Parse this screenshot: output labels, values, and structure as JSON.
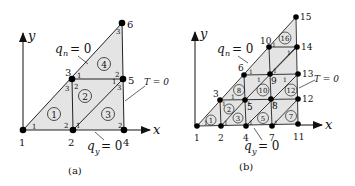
{
  "panels": [
    {
      "caption": "(a)",
      "axes": {
        "x_label": "x",
        "y_label": "y"
      },
      "boundary_conditions": {
        "hypotenuse": {
          "symbol": "q",
          "subscript": "n",
          "text": "= 0"
        },
        "bottom": {
          "symbol": "q",
          "subscript": "y",
          "text": "= 0"
        },
        "right": {
          "text": "T = 0"
        }
      },
      "nodes": [
        {
          "id": "1",
          "x": 23,
          "y": 130
        },
        {
          "id": "2",
          "x": 73,
          "y": 130
        },
        {
          "id": "3",
          "x": 72,
          "y": 79
        },
        {
          "id": "4",
          "x": 124,
          "y": 130
        },
        {
          "id": "5",
          "x": 123,
          "y": 79
        },
        {
          "id": "6",
          "x": 122,
          "y": 23
        }
      ],
      "elements": [
        {
          "id": "1",
          "nodes": [
            "1",
            "2",
            "3"
          ]
        },
        {
          "id": "2",
          "nodes": [
            "2",
            "5",
            "3"
          ]
        },
        {
          "id": "3",
          "nodes": [
            "2",
            "4",
            "5"
          ]
        },
        {
          "id": "4",
          "nodes": [
            "3",
            "5",
            "6"
          ]
        }
      ]
    },
    {
      "caption": "(b)",
      "axes": {
        "x_label": "x",
        "y_label": "y"
      },
      "boundary_conditions": {
        "hypotenuse": {
          "symbol": "q",
          "subscript": "n",
          "text": "= 0"
        },
        "bottom": {
          "symbol": "q",
          "subscript": "y",
          "text": "= 0"
        },
        "right": {
          "text": "T = 0"
        }
      },
      "nodes": [
        {
          "id": "1",
          "x": 197,
          "y": 126
        },
        {
          "id": "2",
          "x": 221,
          "y": 126
        },
        {
          "id": "3",
          "x": 220,
          "y": 100
        },
        {
          "id": "4",
          "x": 246,
          "y": 126
        },
        {
          "id": "5",
          "x": 245,
          "y": 100
        },
        {
          "id": "6",
          "x": 244,
          "y": 75
        },
        {
          "id": "7",
          "x": 272,
          "y": 126
        },
        {
          "id": "8",
          "x": 271,
          "y": 99
        },
        {
          "id": "9",
          "x": 270,
          "y": 74
        },
        {
          "id": "10",
          "x": 269,
          "y": 47
        },
        {
          "id": "11",
          "x": 298,
          "y": 124
        },
        {
          "id": "12",
          "x": 298,
          "y": 99
        },
        {
          "id": "13",
          "x": 298,
          "y": 74
        },
        {
          "id": "14",
          "x": 297,
          "y": 47
        },
        {
          "id": "15",
          "x": 296,
          "y": 17
        }
      ],
      "element_labels": [
        "1",
        "2",
        "3",
        "5",
        "7",
        "8",
        "10",
        "12",
        "16"
      ]
    }
  ]
}
